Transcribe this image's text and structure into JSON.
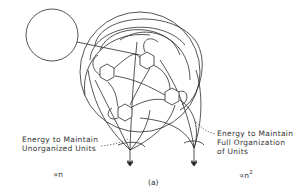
{
  "figure": {
    "caption": "(a)",
    "labels": {
      "left_line1": "Energy to Maintain",
      "left_line2": "Unorganized Units",
      "right_line1": "Energy to Maintain",
      "right_line2": "Full Organization",
      "right_line3": "of Units"
    },
    "proportionality": {
      "left": "∝n",
      "right_base": "∝n",
      "right_exp": "2"
    },
    "elements": {
      "source_circle": "energy source circle",
      "units": [
        "hexagon unit 1",
        "hexagon unit 2",
        "hexagon unit 3",
        "hexagon unit 4"
      ],
      "sinks": [
        "heat sink left",
        "heat sink right"
      ]
    },
    "colors": {
      "stroke": "#2a2a2a",
      "background": "#ffffff"
    }
  }
}
